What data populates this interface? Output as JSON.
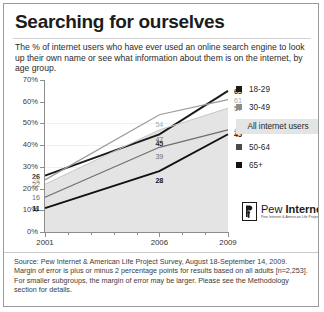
{
  "card": {
    "title": "Searching for ourselves",
    "subtitle": "The % of internet users who have ever used an online search engine to look up their own name or see what information about them is on the internet, by age group."
  },
  "legend": {
    "items": [
      {
        "label": "18-29",
        "color": "#1a1a1a"
      },
      {
        "label": "30-49",
        "color": "#8c8c8c"
      },
      {
        "label": "50-64",
        "color": "#4a4a4a"
      },
      {
        "label": "65+",
        "color": "#111111"
      }
    ],
    "band_label": "All internet users"
  },
  "logo": {
    "name_light": "Pew ",
    "name_bold": "Internet",
    "tagline": "Pew Internet & American Life Project"
  },
  "footer": {
    "source": "Source: Pew Internet & American Life Project Survey, August 18-September 14, 2009. Margin of error is plus or minus 2 percentage points for results based on all adults [n=2,253]. For smaller subgroups, the margin of error may be larger. Please see the Methodology section for details."
  },
  "chart_data": {
    "type": "line",
    "title": "Searching for ourselves",
    "subtitle": "The % of internet users who have ever used an online search engine to look up their own name or see what information about them is on the internet, by age group.",
    "xlabel": "",
    "ylabel": "",
    "x": [
      2001,
      2006,
      2009
    ],
    "xtick_labels": [
      "2001",
      "2006",
      "2009"
    ],
    "ytick_labels": [
      "0%",
      "10%",
      "20%",
      "30%",
      "40%",
      "50%",
      "60%",
      "70%"
    ],
    "ylim": [
      0,
      70
    ],
    "xlim": [
      2001,
      2009
    ],
    "grid": false,
    "legend_position": "right",
    "series": [
      {
        "name": "18-29",
        "values": [
          26,
          45,
          65
        ],
        "color": "#1a1a1a",
        "label_style": "dark"
      },
      {
        "name": "30-49",
        "values": [
          24,
          54,
          61
        ],
        "color": "#9b9b9b",
        "label_style": "light"
      },
      {
        "name": "All internet users",
        "values": [
          22,
          47,
          57
        ],
        "color": "#c6c6c6",
        "label_style": "mid",
        "is_band": true
      },
      {
        "name": "50-64",
        "values": [
          16,
          39,
          47
        ],
        "color": "#6e6e6e",
        "label_style": "mid"
      },
      {
        "name": "65+",
        "values": [
          11,
          28,
          45
        ],
        "color": "#111111",
        "label_style": "bold"
      }
    ],
    "point_labels": [
      {
        "series": "18-29",
        "x": 2001,
        "value": "26",
        "style": "dark"
      },
      {
        "series": "30-49",
        "x": 2001,
        "value": "24",
        "style": "light"
      },
      {
        "series": "All internet users",
        "x": 2001,
        "value": "22",
        "style": "mid"
      },
      {
        "series": "50-64",
        "x": 2001,
        "value": "16",
        "style": "mid"
      },
      {
        "series": "65+",
        "x": 2001,
        "value": "11",
        "style": "bold"
      },
      {
        "series": "30-49",
        "x": 2006,
        "value": "54",
        "style": "light"
      },
      {
        "series": "18-29",
        "x": 2006,
        "value": "45",
        "style": "dark"
      },
      {
        "series": "All internet users",
        "x": 2006,
        "value": "47",
        "style": "mid"
      },
      {
        "series": "50-64",
        "x": 2006,
        "value": "39",
        "style": "mid"
      },
      {
        "series": "65+",
        "x": 2006,
        "value": "28",
        "style": "bold"
      },
      {
        "series": "18-29",
        "x": 2009,
        "value": "65",
        "style": "dark"
      },
      {
        "series": "30-49",
        "x": 2009,
        "value": "61",
        "style": "light"
      },
      {
        "series": "All internet users",
        "x": 2009,
        "value": "57",
        "style": "mid"
      },
      {
        "series": "50-64",
        "x": 2009,
        "value": "47",
        "style": "mid"
      },
      {
        "series": "65+",
        "x": 2009,
        "value": "45",
        "style": "bold"
      }
    ]
  }
}
